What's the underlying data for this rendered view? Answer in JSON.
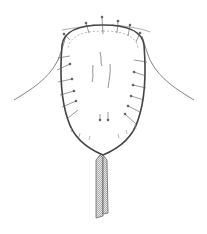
{
  "figure": {
    "colors": {
      "background": "#ffffff",
      "line": "#555555",
      "hatch": "#9a9a9a"
    }
  }
}
